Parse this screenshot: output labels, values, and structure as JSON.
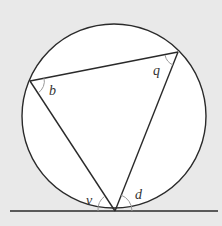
{
  "diagram": {
    "colors": {
      "background": "#e9e9e9",
      "circle_fill": "#ffffff",
      "stroke": "#2a2a2a",
      "arc_mark": "#9a9a9a"
    },
    "circle": {
      "cx": 114,
      "cy": 116,
      "r": 92
    },
    "points": {
      "B": {
        "x": 30,
        "y": 81
      },
      "Q": {
        "x": 178,
        "y": 52
      },
      "T": {
        "x": 115,
        "y": 211
      }
    },
    "tangent_line": {
      "x1": 10,
      "y1": 211,
      "x2": 218,
      "y2": 211
    },
    "labels": {
      "b": "b",
      "q": "q",
      "v": "v",
      "d": "d"
    }
  }
}
